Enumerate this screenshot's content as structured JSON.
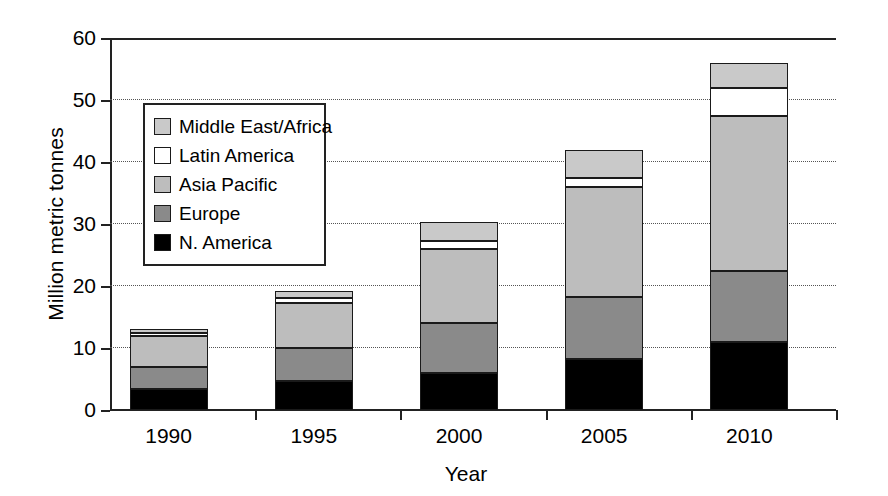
{
  "chart_data": {
    "type": "bar",
    "subtype": "stacked",
    "title": "",
    "xlabel": "Year",
    "ylabel": "Million metric tonnes",
    "categories": [
      "1990",
      "1995",
      "2000",
      "2005",
      "2010"
    ],
    "ylim": [
      0,
      60
    ],
    "yticks": [
      0,
      10,
      20,
      30,
      40,
      50,
      60
    ],
    "grid": "horizontal-dotted",
    "legend_position": "upper-left-inside",
    "series": [
      {
        "name": "N. America",
        "color": "#000000",
        "values": [
          3.4,
          4.6,
          6.0,
          8.3,
          11.0
        ]
      },
      {
        "name": "Europe",
        "color": "#8a8a8a",
        "values": [
          3.6,
          5.4,
          8.0,
          10.0,
          11.5
        ]
      },
      {
        "name": "Asia Pacific",
        "color": "#bdbdbd",
        "values": [
          4.9,
          7.3,
          12.0,
          17.7,
          25.0
        ]
      },
      {
        "name": "Latin America",
        "color": "#ffffff",
        "values": [
          0.5,
          0.7,
          1.3,
          1.5,
          4.5
        ]
      },
      {
        "name": "Middle East/Africa",
        "color": "#c9c9c9",
        "values": [
          0.6,
          1.2,
          3.0,
          4.5,
          4.0
        ]
      }
    ],
    "totals": [
      13.0,
      19.2,
      30.3,
      42.0,
      56.0
    ]
  },
  "legend": {
    "items": [
      {
        "label": "Middle East/Africa",
        "color": "#c9c9c9"
      },
      {
        "label": "Latin America",
        "color": "#ffffff"
      },
      {
        "label": "Asia Pacific",
        "color": "#bdbdbd"
      },
      {
        "label": "Europe",
        "color": "#8a8a8a"
      },
      {
        "label": "N. America",
        "color": "#000000"
      }
    ]
  }
}
